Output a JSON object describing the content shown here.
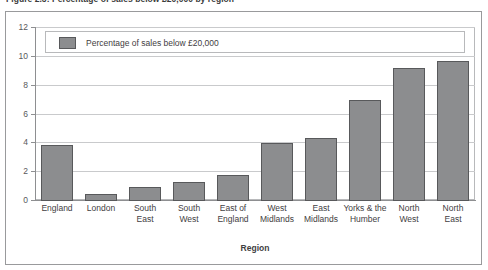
{
  "figure": {
    "caption": "Figure 2.3: Percentage of sales below £20,000 by region"
  },
  "chart_data": {
    "type": "bar",
    "title": "",
    "xlabel": "Region",
    "ylabel": "",
    "ylim": [
      0,
      12
    ],
    "yticks": [
      0,
      2,
      4,
      6,
      8,
      10,
      12
    ],
    "grid": true,
    "legend_position": "top-left",
    "bar_color": "#8c8d8f",
    "bar_border_color": "#58595b",
    "categories": [
      "England",
      "London",
      "South East",
      "South West",
      "East of England",
      "West Midlands",
      "East Midlands",
      "Yorks & the Humber",
      "North West",
      "North East"
    ],
    "category_lines": [
      [
        "England"
      ],
      [
        "London"
      ],
      [
        "South",
        "East"
      ],
      [
        "South",
        "West"
      ],
      [
        "East of",
        "England"
      ],
      [
        "West",
        "Midlands"
      ],
      [
        "East",
        "Midlands"
      ],
      [
        "Yorks & the",
        "Humber"
      ],
      [
        "North",
        "West"
      ],
      [
        "North",
        "East"
      ]
    ],
    "series": [
      {
        "name": "Percentage of sales below £20,000",
        "values": [
          3.9,
          0.5,
          1.0,
          1.3,
          1.8,
          4.0,
          4.4,
          7.0,
          9.2,
          9.7
        ]
      }
    ]
  },
  "legend": {
    "entries": [
      {
        "label": "Percentage of sales below £20,000",
        "color": "#8c8d8f"
      }
    ]
  },
  "axis": {
    "y_tick_labels": [
      "12",
      "10",
      "8",
      "6",
      "4",
      "2",
      "0"
    ],
    "x_title": "Region"
  }
}
